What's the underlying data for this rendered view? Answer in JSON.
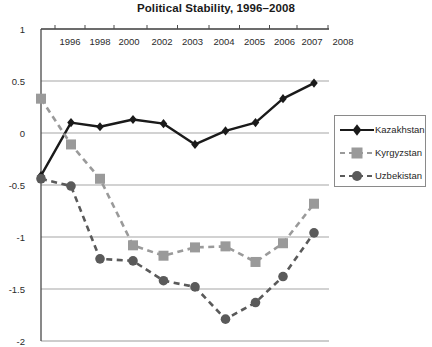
{
  "chart_data": {
    "type": "line",
    "title": "Political Stability, 1996–2008",
    "xlabel": "",
    "ylabel": "",
    "categories": [
      "1996",
      "1998",
      "2000",
      "2002",
      "2003",
      "2004",
      "2005",
      "2006",
      "2007",
      "2008"
    ],
    "x_tick_labels": [
      "1996",
      "1998",
      "2000",
      "2002",
      "2003",
      "2004",
      "2005",
      "2006",
      "2007",
      "2008"
    ],
    "y_tick_labels": [
      "1",
      "0.5",
      "0",
      "-0.5",
      "-1",
      "-1.5",
      "-2"
    ],
    "y_ticks": [
      1,
      0.5,
      0,
      -0.5,
      -1,
      -1.5,
      -2
    ],
    "ylim": [
      -2,
      1
    ],
    "grid": true,
    "x_axis_position": "top",
    "legend_position": "right",
    "series": [
      {
        "name": "Kazakhstan",
        "marker": "diamond",
        "line_style": "solid",
        "color": "#1a1a1a",
        "values": [
          -0.41,
          0.1,
          0.06,
          0.13,
          0.09,
          -0.11,
          0.02,
          0.1,
          0.33,
          0.48
        ]
      },
      {
        "name": "Kyrgyzstan",
        "marker": "square",
        "line_style": "dashed",
        "color": "#9a9a9a",
        "values": [
          0.33,
          -0.11,
          -0.44,
          -1.08,
          -1.18,
          -1.1,
          -1.09,
          -1.24,
          -1.06,
          -0.68
        ]
      },
      {
        "name": "Uzbekistan",
        "marker": "circle",
        "line_style": "dashed",
        "color": "#5a5a5a",
        "values": [
          -0.44,
          -0.51,
          -1.21,
          -1.23,
          -1.42,
          -1.48,
          -1.79,
          -1.63,
          -1.38,
          -0.96
        ]
      }
    ]
  },
  "legend": {
    "items": [
      {
        "label": "Kazakhstan"
      },
      {
        "label": "Kyrgyzstan"
      },
      {
        "label": "Uzbekistan"
      }
    ]
  },
  "colors": {
    "kazakhstan": "#1a1a1a",
    "kyrgyzstan": "#9a9a9a",
    "uzbekistan": "#5a5a5a",
    "axis": "#6e6e6e",
    "grid": "#9b9b9b"
  }
}
